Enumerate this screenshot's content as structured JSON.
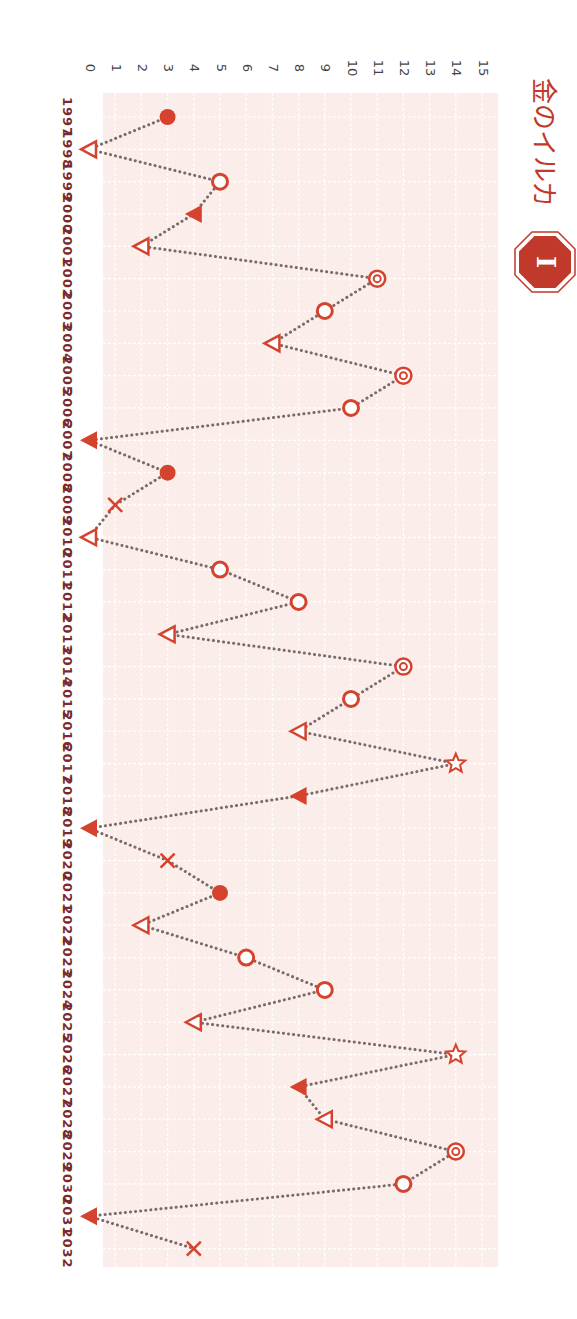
{
  "chart_data": {
    "type": "line",
    "orientation": "rotated-90-clockwise",
    "title": "金のイルカ",
    "badge": "I",
    "xlabel": "",
    "ylabel": "",
    "ylim": [
      0,
      15
    ],
    "y_ticks": [
      0,
      1,
      2,
      3,
      4,
      5,
      6,
      7,
      8,
      9,
      10,
      11,
      12,
      13,
      14,
      15
    ],
    "grid": true,
    "legend": null,
    "line_style": "dotted",
    "categories": [
      "1997",
      "1998",
      "1999",
      "2000",
      "2001",
      "2002",
      "2003",
      "2004",
      "2005",
      "2006",
      "2007",
      "2008",
      "2009",
      "2010",
      "2011",
      "2012",
      "2013",
      "2014",
      "2015",
      "2016",
      "2017",
      "2018",
      "2019",
      "2020",
      "2021",
      "2022",
      "2023",
      "2024",
      "2025",
      "2026",
      "2027",
      "2028",
      "2029",
      "2030",
      "2031",
      "2032"
    ],
    "values": [
      3,
      0,
      5,
      4,
      2,
      11,
      9,
      7,
      12,
      10,
      0,
      3,
      1,
      0,
      5,
      8,
      3,
      12,
      10,
      8,
      14,
      8,
      0,
      3,
      5,
      2,
      6,
      9,
      4,
      14,
      8,
      9,
      14,
      12,
      0,
      4
    ],
    "markers": [
      "filled-circle",
      "open-triangle",
      "open-circle",
      "filled-triangle",
      "open-triangle",
      "double-circle",
      "open-circle",
      "open-triangle",
      "double-circle",
      "open-circle",
      "filled-triangle",
      "filled-circle",
      "cross",
      "open-triangle",
      "open-circle",
      "open-circle",
      "open-triangle",
      "double-circle",
      "open-circle",
      "open-triangle",
      "star",
      "filled-triangle",
      "filled-triangle",
      "cross",
      "filled-circle",
      "open-triangle",
      "open-circle",
      "open-circle",
      "open-triangle",
      "star",
      "filled-triangle",
      "open-triangle",
      "double-circle",
      "open-circle",
      "filled-triangle",
      "cross"
    ],
    "colors": {
      "accent": "#d5432f",
      "line": "#7a6a6a",
      "plot_bg": "#fbeeea",
      "grid": "#ffffff",
      "year_label": "#7a2a2a",
      "tick_label": "#444444",
      "title": "#c0392b",
      "badge_fill": "#c0392b"
    }
  }
}
